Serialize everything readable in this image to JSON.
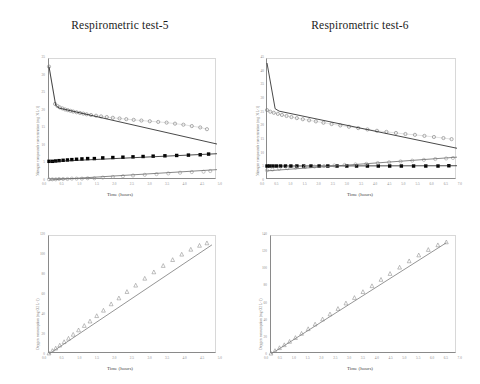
{
  "figure": {
    "panels": [
      {
        "id": "top-left",
        "title": "Respirometric test-5",
        "xlabel": "Time (hours)",
        "ylabel": "Nitrogen compounds concentration (mg N L-1)",
        "xticklabels": [
          "0.0",
          "0.5",
          "1.0",
          "1.5",
          "2.0",
          "2.5",
          "3.0",
          "3.5",
          "4.0",
          "4.5",
          "5.0"
        ],
        "yticklabels": [
          "35",
          "30",
          "25",
          "20",
          "15",
          "10",
          "5",
          "0"
        ]
      },
      {
        "id": "top-right",
        "title": "Respirometric test-6",
        "xlabel": "Time (hours)",
        "ylabel": "Nitrogen compounds concentration (mg N L-1)",
        "xticklabels": [
          "0.0",
          "0.5",
          "1.0",
          "1.5",
          "2.0",
          "2.5",
          "3.0",
          "3.5",
          "4.0",
          "4.5",
          "5.0",
          "5.5",
          "6.0",
          "6.5",
          "7.0"
        ],
        "yticklabels": [
          "45",
          "40",
          "35",
          "30",
          "25",
          "20",
          "15",
          "10",
          "5",
          "0"
        ]
      },
      {
        "id": "bottom-left",
        "title": "",
        "xlabel": "Time (hours)",
        "ylabel": "Oxygen consumption (mg O2 L-1)",
        "xticklabels": [
          "0.0",
          "0.5",
          "1.0",
          "1.5",
          "2.0",
          "2.5",
          "3.0",
          "3.5",
          "4.0",
          "4.5",
          "5.0"
        ],
        "yticklabels": [
          "120",
          "100",
          "80",
          "60",
          "40",
          "20",
          "0"
        ]
      },
      {
        "id": "bottom-right",
        "title": "",
        "xlabel": "Time (hours)",
        "ylabel": "Oxygen consumption (mg O2 L-1)",
        "xticklabels": [
          "0.0",
          "0.5",
          "1.0",
          "1.5",
          "2.0",
          "2.5",
          "3.0",
          "3.5",
          "4.0",
          "4.5",
          "5.0",
          "5.5",
          "6.0",
          "6.5",
          "7.0"
        ],
        "yticklabels": [
          "140",
          "120",
          "100",
          "80",
          "60",
          "40",
          "20",
          "0"
        ]
      }
    ]
  },
  "chart_data": [
    {
      "id": "top-left",
      "type": "scatter",
      "title": "Respirometric test-5",
      "xlabel": "Time (hours)",
      "ylabel": "Nitrogen compounds concentration (mg N L-1)",
      "xlim": [
        0.0,
        5.0
      ],
      "ylim": [
        0,
        35
      ],
      "grid": false,
      "legend": "none",
      "series": [
        {
          "name": "Ammonium (measured)",
          "marker": "open-circle",
          "color": "#7a7a7a",
          "x": [
            0.0,
            0.18,
            0.25,
            0.32,
            0.4,
            0.48,
            0.56,
            0.64,
            0.72,
            0.82,
            0.92,
            1.02,
            1.12,
            1.25,
            1.4,
            1.55,
            1.72,
            1.9,
            2.1,
            2.3,
            2.52,
            2.75,
            3.0,
            3.25,
            3.5,
            3.75,
            4.0,
            4.25,
            4.5,
            4.7
          ],
          "y": [
            32.8,
            22.0,
            21.4,
            21.0,
            20.7,
            20.4,
            20.2,
            20.0,
            19.8,
            19.6,
            19.4,
            19.2,
            19.0,
            18.8,
            18.6,
            18.4,
            18.2,
            18.0,
            17.8,
            17.6,
            17.4,
            17.2,
            17.0,
            16.8,
            16.6,
            16.3,
            16.0,
            15.6,
            15.2,
            14.7
          ]
        },
        {
          "name": "Ammonium (model fit)",
          "marker": "line",
          "color": "#1a1a1a",
          "x": [
            0.0,
            0.2,
            0.3,
            5.0
          ],
          "y": [
            32.8,
            21.6,
            20.8,
            10.4
          ]
        },
        {
          "name": "Nitrite (measured)",
          "marker": "filled-square",
          "color": "#000000",
          "x": [
            0.0,
            0.1,
            0.2,
            0.3,
            0.42,
            0.55,
            0.68,
            0.82,
            0.98,
            1.15,
            1.35,
            1.6,
            1.9,
            2.2,
            2.5,
            2.8,
            3.1,
            3.45,
            3.8,
            4.15,
            4.5,
            4.75
          ],
          "y": [
            5.4,
            5.4,
            5.5,
            5.6,
            5.7,
            5.8,
            5.9,
            6.0,
            6.1,
            6.2,
            6.2,
            6.4,
            6.5,
            6.6,
            6.7,
            6.8,
            6.9,
            7.0,
            7.1,
            7.2,
            7.3,
            7.5
          ]
        },
        {
          "name": "Nitrite (model fit)",
          "marker": "line",
          "color": "#1a1a1a",
          "x": [
            0.0,
            5.0
          ],
          "y": [
            5.3,
            7.6
          ]
        },
        {
          "name": "Nitrate (measured)",
          "marker": "open-circle",
          "color": "#9a9a9a",
          "x": [
            0.0,
            0.1,
            0.2,
            0.3,
            0.42,
            0.55,
            0.68,
            0.82,
            0.98,
            1.15,
            1.35,
            1.6,
            1.9,
            2.2,
            2.5,
            2.85,
            3.2,
            3.55,
            3.9,
            4.25,
            4.6,
            4.8
          ],
          "y": [
            0.2,
            0.2,
            0.2,
            0.3,
            0.3,
            0.3,
            0.4,
            0.4,
            0.4,
            0.5,
            0.5,
            0.7,
            0.9,
            1.1,
            1.3,
            1.5,
            1.7,
            1.9,
            2.1,
            2.3,
            2.4,
            2.6
          ]
        },
        {
          "name": "Nitrate (model fit)",
          "marker": "line",
          "color": "#6a6a6a",
          "x": [
            0.0,
            5.0
          ],
          "y": [
            0.0,
            3.0
          ]
        }
      ]
    },
    {
      "id": "top-right",
      "type": "scatter",
      "title": "Respirometric test-6",
      "xlabel": "Time (hours)",
      "ylabel": "Nitrogen compounds concentration (mg N L-1)",
      "xlim": [
        0.0,
        7.0
      ],
      "ylim": [
        0,
        45
      ],
      "grid": false,
      "legend": "none",
      "series": [
        {
          "name": "Ammonium (measured)",
          "marker": "open-circle",
          "color": "#7a7a7a",
          "x": [
            0.0,
            0.12,
            0.25,
            0.4,
            0.55,
            0.72,
            0.9,
            1.1,
            1.32,
            1.55,
            1.8,
            2.08,
            2.38,
            2.7,
            3.02,
            3.36,
            3.7,
            4.05,
            4.4,
            4.75,
            5.1,
            5.45,
            5.8,
            6.15,
            6.5,
            6.8
          ],
          "y": [
            26.0,
            25.4,
            25.0,
            24.6,
            24.2,
            23.8,
            23.4,
            23.0,
            22.6,
            22.2,
            21.8,
            21.3,
            20.8,
            20.3,
            19.8,
            19.3,
            18.8,
            18.3,
            17.9,
            17.5,
            17.1,
            16.8,
            16.4,
            16.0,
            15.6,
            15.2
          ]
        },
        {
          "name": "Ammonium (model fit)",
          "marker": "line",
          "color": "#1a1a1a",
          "x": [
            0.0,
            0.3,
            0.45,
            7.0
          ],
          "y": [
            43.5,
            26.5,
            25.6,
            11.8
          ]
        },
        {
          "name": "Nitrite (measured)",
          "marker": "filled-square",
          "color": "#000000",
          "x": [
            0.0,
            0.1,
            0.22,
            0.35,
            0.5,
            0.68,
            0.88,
            1.1,
            1.35,
            1.62,
            1.92,
            2.24,
            2.58,
            2.94,
            3.3,
            3.7,
            4.1,
            4.52,
            4.95,
            5.4,
            5.85,
            6.3,
            6.7
          ],
          "y": [
            5.2,
            5.2,
            5.2,
            5.2,
            5.2,
            5.2,
            5.2,
            5.2,
            5.2,
            5.2,
            5.2,
            5.2,
            5.2,
            5.2,
            5.2,
            5.2,
            5.2,
            5.2,
            5.2,
            5.2,
            5.2,
            5.2,
            5.3
          ]
        },
        {
          "name": "Nitrite (model fit)",
          "marker": "line",
          "color": "#1a1a1a",
          "x": [
            0.0,
            7.0
          ],
          "y": [
            5.2,
            5.3
          ]
        },
        {
          "name": "Nitrate (measured)",
          "marker": "open-circle",
          "color": "#9a9a9a",
          "x": [
            0.0,
            0.2,
            0.45,
            0.75,
            1.05,
            1.4,
            1.75,
            2.1,
            2.48,
            2.86,
            3.26,
            3.66,
            4.08,
            4.5,
            4.92,
            5.35,
            5.78,
            6.2,
            6.6,
            6.85
          ],
          "y": [
            3.6,
            3.9,
            4.2,
            4.4,
            4.6,
            4.8,
            5.0,
            5.2,
            5.4,
            5.6,
            5.8,
            6.0,
            6.3,
            6.6,
            6.9,
            7.2,
            7.5,
            7.8,
            8.0,
            8.2
          ]
        },
        {
          "name": "Nitrate (model fit)",
          "marker": "line",
          "color": "#6a6a6a",
          "x": [
            0.0,
            7.0
          ],
          "y": [
            3.4,
            8.5
          ]
        }
      ]
    },
    {
      "id": "bottom-left",
      "type": "scatter",
      "title": "",
      "xlabel": "Time (hours)",
      "ylabel": "Oxygen consumption (mg O2 L-1)",
      "xlim": [
        0.0,
        5.0
      ],
      "ylim": [
        0,
        120
      ],
      "grid": false,
      "legend": "none",
      "series": [
        {
          "name": "Oxygen consumption (measured)",
          "marker": "open-triangle",
          "color": "#8a8a8a",
          "x": [
            0.0,
            0.1,
            0.2,
            0.32,
            0.45,
            0.58,
            0.72,
            0.88,
            1.05,
            1.22,
            1.42,
            1.62,
            1.85,
            2.08,
            2.32,
            2.58,
            2.85,
            3.12,
            3.4,
            3.68,
            3.95,
            4.22,
            4.48,
            4.7
          ],
          "y": [
            1.0,
            3.5,
            6.0,
            9.0,
            12.5,
            16.0,
            20.0,
            24.5,
            29.0,
            33.5,
            39.0,
            44.5,
            51.0,
            57.0,
            63.5,
            70.0,
            77.0,
            83.5,
            90.0,
            96.0,
            101.5,
            106.5,
            110.5,
            113.0
          ]
        },
        {
          "name": "Oxygen consumption (model fit)",
          "marker": "line",
          "color": "#7a7a7a",
          "x": [
            0.0,
            4.85
          ],
          "y": [
            0.0,
            111.0
          ]
        }
      ]
    },
    {
      "id": "bottom-right",
      "type": "scatter",
      "title": "",
      "xlabel": "Time (hours)",
      "ylabel": "Oxygen consumption (mg O2 L-1)",
      "xlim": [
        0.0,
        7.0
      ],
      "ylim": [
        0,
        140
      ],
      "grid": false,
      "legend": "none",
      "series": [
        {
          "name": "Oxygen consumption (measured)",
          "marker": "open-triangle",
          "color": "#8a8a8a",
          "x": [
            0.0,
            0.15,
            0.32,
            0.5,
            0.7,
            0.92,
            1.15,
            1.4,
            1.66,
            1.94,
            2.22,
            2.52,
            2.82,
            3.14,
            3.46,
            3.8,
            4.14,
            4.48,
            4.84,
            5.2,
            5.56,
            5.92,
            6.28,
            6.6
          ],
          "y": [
            1.0,
            4.0,
            7.5,
            11.0,
            15.0,
            19.5,
            24.5,
            30.0,
            35.5,
            41.5,
            47.5,
            54.0,
            60.5,
            67.0,
            74.0,
            81.0,
            88.5,
            95.5,
            103.0,
            110.5,
            117.5,
            124.0,
            129.5,
            133.0
          ]
        },
        {
          "name": "Oxygen consumption (model fit)",
          "marker": "line",
          "color": "#7a7a7a",
          "x": [
            0.0,
            6.6
          ],
          "y": [
            0.0,
            132.0
          ]
        }
      ]
    }
  ]
}
